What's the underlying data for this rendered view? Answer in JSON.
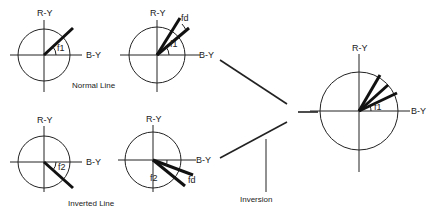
{
  "diagram": {
    "axis_vertical_label": "R-Y",
    "axis_horizontal_label": "B-Y",
    "panels": [
      {
        "id": "normal-single",
        "angle_label": "f1"
      },
      {
        "id": "normal-deviation",
        "angle_label": "f1",
        "deviation_label": "fd"
      },
      {
        "id": "inverted-single",
        "angle_label": "f2"
      },
      {
        "id": "inverted-deviation",
        "angle_label": "f2",
        "deviation_label": "fd"
      },
      {
        "id": "result",
        "angle_label": "f1"
      }
    ],
    "captions": {
      "normal_line": "Normal Line",
      "inverted_line": "Inverted Line",
      "inversion": "Inversion"
    },
    "colors": {
      "ink": "#222222",
      "background": "#ffffff"
    }
  }
}
